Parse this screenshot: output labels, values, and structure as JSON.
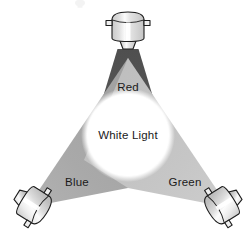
{
  "diagram": {
    "center": {
      "label": "White Light",
      "color": "#ffffff",
      "cx": 128,
      "cy": 135,
      "r": 41
    },
    "beams": [
      {
        "id": "red",
        "label": "Red",
        "color": "#555555",
        "source_position": "top",
        "label_x": 128,
        "label_y": 91
      },
      {
        "id": "blue",
        "label": "Blue",
        "color": "#a6a6a6",
        "source_position": "bottom-left",
        "label_x": 77,
        "label_y": 182
      },
      {
        "id": "green",
        "label": "Green",
        "color": "#c2c2c2",
        "source_position": "bottom-right",
        "label_x": 185,
        "label_y": 182
      }
    ],
    "fixtures": [
      {
        "id": "spotlight-top",
        "name": "top-spotlight",
        "body_color": "#d8d8d8",
        "highlight_color": "#fdfdfd",
        "outline_color": "#1d1d1d",
        "aim": "down"
      },
      {
        "id": "spotlight-bottom-left",
        "name": "bottom-left-spotlight",
        "body_color": "#d8d8d8",
        "highlight_color": "#fdfdfd",
        "outline_color": "#1d1d1d",
        "aim": "up-right"
      },
      {
        "id": "spotlight-bottom-right",
        "name": "bottom-right-spotlight",
        "body_color": "#d8d8d8",
        "highlight_color": "#fdfdfd",
        "outline_color": "#1d1d1d",
        "aim": "up-left"
      }
    ],
    "background_color": "#ffffff"
  }
}
